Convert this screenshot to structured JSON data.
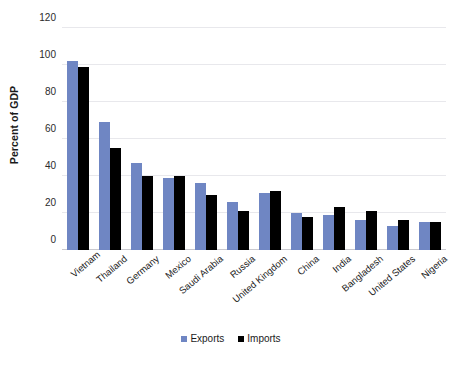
{
  "chart_data": {
    "type": "bar",
    "title": "",
    "subtitle": "",
    "xlabel": "",
    "ylabel": "Percent of GDP",
    "ylim": [
      0,
      120
    ],
    "yticks": [
      0,
      20,
      40,
      60,
      80,
      100,
      120
    ],
    "grid": true,
    "legend_position": "bottom",
    "categories": [
      "Vietnam",
      "Thailand",
      "Germany",
      "Mexico",
      "Saudi Arabia",
      "Russia",
      "United Kingdom",
      "China",
      "India",
      "Bangladesh",
      "United States",
      "Nigeria"
    ],
    "series": [
      {
        "name": "Exports",
        "color": "#6f86c3",
        "values": [
          102,
          69,
          47,
          39,
          36,
          26,
          31,
          20,
          19,
          16,
          13,
          15
        ]
      },
      {
        "name": "Imports",
        "color": "#000000",
        "values": [
          99,
          55,
          40,
          40,
          30,
          21,
          32,
          18,
          23,
          21,
          16,
          15
        ]
      }
    ]
  }
}
